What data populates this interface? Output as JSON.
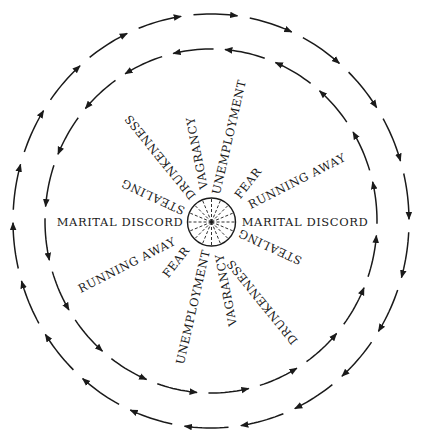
{
  "diagram": {
    "colors": {
      "ink": "#1a1a1a",
      "background": "#ffffff"
    },
    "center": {
      "x": 211,
      "y": 221
    },
    "hub": {
      "cx": 211.5,
      "cy": 222,
      "r": 24,
      "spokes": 16,
      "spoke_style": "dashed"
    },
    "rings": [
      {
        "name": "outer-ring",
        "rx": 198,
        "ry": 207,
        "segments": 22,
        "direction": "clockwise",
        "arrowheads": true
      },
      {
        "name": "inner-ring",
        "rx": 166,
        "ry": 172,
        "segments": 20,
        "direction": "counter-clockwise",
        "arrowheads": true
      }
    ],
    "labels": [
      {
        "id": "marital-discord-left",
        "text": "MARITAL DISCORD",
        "x": 120,
        "y": 222,
        "rotate": 0
      },
      {
        "id": "marital-discord-right",
        "text": "MARITAL DISCORD",
        "x": 305,
        "y": 222,
        "rotate": 0
      },
      {
        "id": "running-away-top",
        "text": "RUNNING AWAY",
        "x": 297,
        "y": 181,
        "rotate": -27
      },
      {
        "id": "running-away-bottom",
        "text": "RUNNING AWAY",
        "x": 127,
        "y": 265,
        "rotate": -27
      },
      {
        "id": "fear-top",
        "text": "FEAR",
        "x": 248,
        "y": 183,
        "rotate": -52
      },
      {
        "id": "fear-bottom",
        "text": "FEAR",
        "x": 176,
        "y": 262,
        "rotate": -52
      },
      {
        "id": "unemployment-top",
        "text": "UNEMPLOYMENT",
        "x": 229,
        "y": 137,
        "rotate": -77
      },
      {
        "id": "unemployment-bottom",
        "text": "UNEMPLOYMENT",
        "x": 193,
        "y": 307,
        "rotate": -77
      },
      {
        "id": "vagrancy-top",
        "text": "VAGRANCY",
        "x": 197,
        "y": 153,
        "rotate": -101
      },
      {
        "id": "vagrancy-bottom",
        "text": "VAGRANCY",
        "x": 226,
        "y": 290,
        "rotate": -101
      },
      {
        "id": "drunkenness-top",
        "text": "DRUNKENNESS",
        "x": 160,
        "y": 157,
        "rotate": 231
      },
      {
        "id": "drunkenness-bottom",
        "text": "DRUNKENNESS",
        "x": 262,
        "y": 302,
        "rotate": 231
      },
      {
        "id": "stealing-top",
        "text": "STEALING",
        "x": 153,
        "y": 197,
        "rotate": 205
      },
      {
        "id": "stealing-bottom",
        "text": "STEALING",
        "x": 270,
        "y": 247,
        "rotate": 205
      }
    ]
  }
}
